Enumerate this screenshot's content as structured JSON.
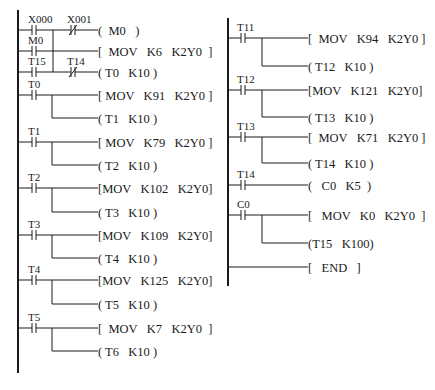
{
  "diagram": {
    "type": "PLC ladder diagram",
    "columns": [
      {
        "id": "left",
        "rail_x": 18,
        "rail_y": [
          10,
          373
        ],
        "rungs": [
          {
            "y": 30,
            "contacts": [
              {
                "label": "X000",
                "type": "NO",
                "x": 25
              },
              {
                "label": "X001",
                "type": "NC",
                "x": 64
              }
            ],
            "output": {
              "kind": "coil",
              "text": "(  M0   )",
              "x": 100
            }
          },
          {
            "y": 51,
            "contacts": [
              {
                "label": "M0",
                "type": "NO",
                "x": 25
              }
            ],
            "output": {
              "kind": "func",
              "text": "[  MOV   K6   K2Y0  ]",
              "x": 100
            }
          },
          {
            "y": 72,
            "contacts": [
              {
                "label": "T15",
                "type": "NO",
                "x": 25
              },
              {
                "label": "T14",
                "type": "NC",
                "x": 64
              }
            ],
            "output": {
              "kind": "coil",
              "text": "( T0   K10 )",
              "x": 100
            }
          },
          {
            "y": 95,
            "contacts": [
              {
                "label": "T0",
                "type": "NO",
                "x": 25
              }
            ],
            "output": {
              "kind": "func",
              "text": "[ MOV   K91   K2Y0 ]",
              "x": 100
            },
            "branch": {
              "y": 118,
              "text": "( T1   K10 )"
            }
          },
          {
            "y": 142,
            "contacts": [
              {
                "label": "T1",
                "type": "NO",
                "x": 25
              }
            ],
            "output": {
              "kind": "func",
              "text": "[ MOV   K79   K2Y0 ]",
              "x": 100
            },
            "branch": {
              "y": 165,
              "text": "( T2   K10 )"
            }
          },
          {
            "y": 188,
            "contacts": [
              {
                "label": "T2",
                "type": "NO",
                "x": 25
              }
            ],
            "output": {
              "kind": "func",
              "text": "[MOV   K102   K2Y0]",
              "x": 100
            },
            "branch": {
              "y": 212,
              "text": "( T3   K10 )"
            }
          },
          {
            "y": 235,
            "contacts": [
              {
                "label": "T3",
                "type": "NO",
                "x": 25
              }
            ],
            "output": {
              "kind": "func",
              "text": "[MOV   K109   K2Y0]",
              "x": 100
            },
            "branch": {
              "y": 258,
              "text": "( T4   K10 )"
            }
          },
          {
            "y": 280,
            "contacts": [
              {
                "label": "T4",
                "type": "NO",
                "x": 25
              }
            ],
            "output": {
              "kind": "func",
              "text": "[MOV   K125   K2Y0]",
              "x": 100
            },
            "branch": {
              "y": 304,
              "text": "( T5   K10 )"
            }
          },
          {
            "y": 328,
            "contacts": [
              {
                "label": "T5",
                "type": "NO",
                "x": 25
              }
            ],
            "output": {
              "kind": "func",
              "text": "[  MOV   K7   K2Y0  ]",
              "x": 100
            },
            "branch": {
              "y": 351,
              "text": "( T6   K10 )"
            }
          }
        ],
        "or_block": {
          "merge_x": 53,
          "y_top": 30,
          "y_bottom": 72
        }
      },
      {
        "id": "right",
        "rail_x": 228,
        "rail_y": [
          18,
          286
        ],
        "rungs": [
          {
            "y": 38,
            "contacts": [
              {
                "label": "T11",
                "type": "NO",
                "x": 234
              }
            ],
            "output": {
              "kind": "func",
              "text": "[  MOV   K94   K2Y0 ]",
              "x": 310
            },
            "branch": {
              "y": 66,
              "text": "( T12   K10 )"
            }
          },
          {
            "y": 90,
            "contacts": [
              {
                "label": "T12",
                "type": "NO",
                "x": 234
              }
            ],
            "output": {
              "kind": "func",
              "text": "[MOV   K121   K2Y0]",
              "x": 310
            },
            "branch": {
              "y": 117,
              "text": "( T13   K10 )"
            }
          },
          {
            "y": 137,
            "contacts": [
              {
                "label": "T13",
                "type": "NO",
                "x": 234
              }
            ],
            "output": {
              "kind": "func",
              "text": "[  MOV   K71   K2Y0 ]",
              "x": 310
            },
            "branch": {
              "y": 163,
              "text": "( T14   K10 )"
            }
          },
          {
            "y": 185,
            "contacts": [
              {
                "label": "T14",
                "type": "NO",
                "x": 234
              }
            ],
            "output": {
              "kind": "coil",
              "text": "(   C0   K5  )",
              "x": 310
            }
          },
          {
            "y": 215,
            "contacts": [
              {
                "label": "C0",
                "type": "NO",
                "x": 234
              }
            ],
            "output": {
              "kind": "func",
              "text": "[   MOV   K0   K2Y0  ]",
              "x": 310
            },
            "branch": {
              "y": 243,
              "text": "(T15   K100)"
            }
          },
          {
            "y": 267,
            "contacts": [],
            "output": {
              "kind": "func",
              "text": "[   END   ]",
              "x": 310
            }
          }
        ]
      }
    ]
  }
}
